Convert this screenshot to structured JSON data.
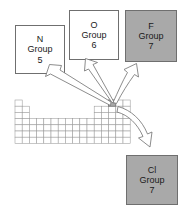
{
  "figure": {
    "kind": "periodic-table-callout-diagram"
  },
  "colors": {
    "highlight_fill": "#a9a9a9",
    "box_gray_fill": "#a9a9a9",
    "box_white_fill": "#ffffff",
    "outline": "#6f6f6f",
    "grid_line": "#9a9a9a",
    "arrow_outline": "#777777",
    "text": "#1a1a1a",
    "background": "#ffffff"
  },
  "boxes": [
    {
      "id": "n",
      "symbol": "N",
      "group_label": "Group",
      "group_number": "5",
      "fill": "white"
    },
    {
      "id": "o",
      "symbol": "O",
      "group_label": "Group",
      "group_number": "6",
      "fill": "white"
    },
    {
      "id": "f",
      "symbol": "F",
      "group_label": "Group",
      "group_number": "7",
      "fill": "gray"
    },
    {
      "id": "cl",
      "symbol": "Cl",
      "group_label": "Group",
      "group_number": "7",
      "fill": "gray"
    }
  ],
  "periodic_table": {
    "cell_width": 7.2,
    "cell_height": 6.2,
    "origin_x": 15,
    "origin_y": 100,
    "columns": 16,
    "rows": 7,
    "highlighted_cell": {
      "col": 13,
      "row": 0
    },
    "row_spans": [
      {
        "row": 0,
        "segments": [
          [
            0,
            1
          ],
          [
            13,
            16
          ]
        ]
      },
      {
        "row": 1,
        "segments": [
          [
            0,
            2
          ],
          [
            11,
            16
          ]
        ]
      },
      {
        "row": 2,
        "segments": [
          [
            0,
            2
          ],
          [
            11,
            16
          ]
        ]
      },
      {
        "row": 3,
        "segments": [
          [
            0,
            16
          ]
        ]
      },
      {
        "row": 4,
        "segments": [
          [
            0,
            16
          ]
        ]
      },
      {
        "row": 5,
        "segments": [
          [
            0,
            16
          ]
        ]
      },
      {
        "row": 6,
        "segments": [
          [
            0,
            16
          ]
        ]
      }
    ]
  },
  "arrows": [
    {
      "id": "arrow-to-n",
      "target": "n",
      "style": "straight-tapered",
      "direction": "up-left"
    },
    {
      "id": "arrow-to-o",
      "target": "o",
      "style": "straight-tapered",
      "direction": "up"
    },
    {
      "id": "arrow-to-f",
      "target": "f",
      "style": "curved",
      "direction": "up-right"
    },
    {
      "id": "arrow-to-cl",
      "target": "cl",
      "style": "curved",
      "direction": "down-right"
    }
  ]
}
